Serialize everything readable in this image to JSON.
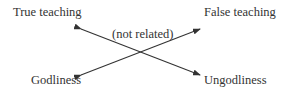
{
  "diagram": {
    "top_left": "True teaching",
    "top_right": "False teaching",
    "bottom_left": "Godliness",
    "bottom_right": "Ungodliness",
    "center_note": "(not related)"
  },
  "colors": {
    "line": "#333333",
    "text": "#333333"
  }
}
